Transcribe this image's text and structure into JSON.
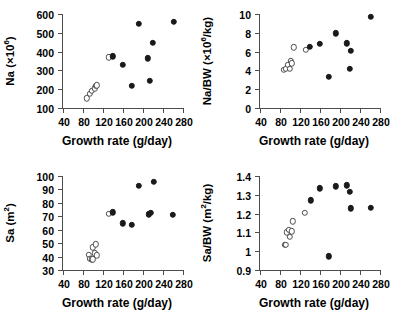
{
  "figure": {
    "shared_xlabel": "Growth rate (g/day)",
    "xticks": [
      40,
      80,
      120,
      160,
      200,
      240,
      280
    ],
    "xlim": [
      40,
      280
    ],
    "marker_filled_color": "#1a1a1a",
    "marker_open_color": "#ffffff",
    "axis_color": "#4d4d4d"
  },
  "chart_data": [
    {
      "panel": "top-left",
      "type": "scatter",
      "title": "",
      "xlabel": "Growth rate (g/day)",
      "ylabel": "Na (×10⁶)",
      "ylabel_main": "Na (×10",
      "ylabel_sup": "6",
      "ylabel_tail": ")",
      "xlim": [
        40,
        280
      ],
      "ylim": [
        100,
        600
      ],
      "xticks": [
        40,
        80,
        120,
        160,
        200,
        240,
        280
      ],
      "yticks": [
        100,
        200,
        300,
        400,
        500,
        600
      ],
      "grid": false,
      "legend": "none",
      "series": [
        {
          "name": "open",
          "marker": "open-circle",
          "points": [
            {
              "x": 88,
              "y": 152
            },
            {
              "x": 94,
              "y": 176
            },
            {
              "x": 98,
              "y": 191
            },
            {
              "x": 103,
              "y": 205
            },
            {
              "x": 106,
              "y": 219
            },
            {
              "x": 108,
              "y": 221
            },
            {
              "x": 131,
              "y": 369
            }
          ]
        },
        {
          "name": "filled",
          "marker": "filled-circle",
          "points": [
            {
              "x": 140,
              "y": 376
            },
            {
              "x": 160,
              "y": 330
            },
            {
              "x": 178,
              "y": 219
            },
            {
              "x": 192,
              "y": 547
            },
            {
              "x": 210,
              "y": 364
            },
            {
              "x": 214,
              "y": 246
            },
            {
              "x": 220,
              "y": 447
            },
            {
              "x": 262,
              "y": 560
            }
          ]
        }
      ]
    },
    {
      "panel": "top-right",
      "type": "scatter",
      "title": "",
      "xlabel": "Growth rate (g/day)",
      "ylabel": "Na/BW (×10⁶/kg)",
      "ylabel_main": "Na/BW (×10",
      "ylabel_sup": "6",
      "ylabel_tail": "/kg)",
      "xlim": [
        40,
        280
      ],
      "ylim": [
        0,
        10
      ],
      "xticks": [
        40,
        80,
        120,
        160,
        200,
        240,
        280
      ],
      "yticks": [
        0,
        2,
        4,
        6,
        8,
        10
      ],
      "grid": false,
      "legend": "none",
      "series": [
        {
          "name": "open",
          "marker": "open-circle",
          "points": [
            {
              "x": 88,
              "y": 4.05
            },
            {
              "x": 92,
              "y": 4.15
            },
            {
              "x": 96,
              "y": 4.6
            },
            {
              "x": 99,
              "y": 4.2
            },
            {
              "x": 102,
              "y": 5.05
            },
            {
              "x": 104,
              "y": 4.75
            },
            {
              "x": 107,
              "y": 6.45
            },
            {
              "x": 131,
              "y": 6.2
            }
          ]
        },
        {
          "name": "filled",
          "marker": "filled-circle",
          "points": [
            {
              "x": 140,
              "y": 6.5
            },
            {
              "x": 160,
              "y": 6.8
            },
            {
              "x": 178,
              "y": 3.35
            },
            {
              "x": 192,
              "y": 7.95
            },
            {
              "x": 214,
              "y": 6.9
            },
            {
              "x": 219,
              "y": 4.15
            },
            {
              "x": 222,
              "y": 6.1
            },
            {
              "x": 262,
              "y": 9.7
            }
          ]
        }
      ]
    },
    {
      "panel": "bottom-left",
      "type": "scatter",
      "title": "",
      "xlabel": "Growth rate (g/day)",
      "ylabel": "Sa (m²)",
      "ylabel_main": "Sa (m",
      "ylabel_sup": "2",
      "ylabel_tail": ")",
      "xlim": [
        40,
        280
      ],
      "ylim": [
        30,
        100
      ],
      "xticks": [
        40,
        80,
        120,
        160,
        200,
        240,
        280
      ],
      "yticks": [
        30,
        40,
        50,
        60,
        70,
        80,
        90,
        100
      ],
      "grid": false,
      "legend": "none",
      "series": [
        {
          "name": "open",
          "marker": "open-circle",
          "points": [
            {
              "x": 91,
              "y": 41.5
            },
            {
              "x": 93,
              "y": 38.5
            },
            {
              "x": 97,
              "y": 38.0
            },
            {
              "x": 99,
              "y": 47.0
            },
            {
              "x": 100,
              "y": 38.0
            },
            {
              "x": 104,
              "y": 42.5
            },
            {
              "x": 106,
              "y": 49.0
            },
            {
              "x": 107,
              "y": 41.0
            },
            {
              "x": 131,
              "y": 72.0
            }
          ]
        },
        {
          "name": "filled",
          "marker": "filled-circle",
          "points": [
            {
              "x": 139,
              "y": 73.0
            },
            {
              "x": 160,
              "y": 64.8
            },
            {
              "x": 177,
              "y": 63.8
            },
            {
              "x": 191,
              "y": 92.5
            },
            {
              "x": 212,
              "y": 71.5
            },
            {
              "x": 216,
              "y": 72.5
            },
            {
              "x": 221,
              "y": 95.5
            },
            {
              "x": 260,
              "y": 71.0
            }
          ]
        }
      ]
    },
    {
      "panel": "bottom-right",
      "type": "scatter",
      "title": "",
      "xlabel": "Growth rate (g/day)",
      "ylabel": "Sa/BW (m²/kg)",
      "ylabel_main": "Sa/BW (m",
      "ylabel_sup": "2",
      "ylabel_tail": "/kg)",
      "xlim": [
        40,
        280
      ],
      "ylim": [
        0.9,
        1.4
      ],
      "xticks": [
        40,
        80,
        120,
        160,
        200,
        240,
        280
      ],
      "yticks": [
        0.9,
        1.0,
        1.1,
        1.2,
        1.3,
        1.4
      ],
      "grid": false,
      "legend": "none",
      "series": [
        {
          "name": "open",
          "marker": "open-circle",
          "points": [
            {
              "x": 89,
              "y": 1.035
            },
            {
              "x": 92,
              "y": 1.035
            },
            {
              "x": 94,
              "y": 1.1
            },
            {
              "x": 97,
              "y": 1.115
            },
            {
              "x": 100,
              "y": 1.075
            },
            {
              "x": 103,
              "y": 1.105
            },
            {
              "x": 105,
              "y": 1.16
            },
            {
              "x": 129,
              "y": 1.205
            }
          ]
        },
        {
          "name": "filled",
          "marker": "filled-circle",
          "points": [
            {
              "x": 141,
              "y": 1.27
            },
            {
              "x": 160,
              "y": 1.335
            },
            {
              "x": 178,
              "y": 0.972
            },
            {
              "x": 192,
              "y": 1.345
            },
            {
              "x": 213,
              "y": 1.35
            },
            {
              "x": 220,
              "y": 1.315
            },
            {
              "x": 222,
              "y": 1.228
            },
            {
              "x": 261,
              "y": 1.23
            }
          ]
        }
      ]
    }
  ]
}
